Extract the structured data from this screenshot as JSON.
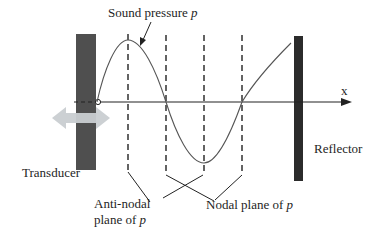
{
  "diagram": {
    "labels": {
      "sound_pressure": "Sound pressure ",
      "sound_pressure_symbol": "p",
      "axis_x": "x",
      "transducer": "Transducer",
      "reflector": "Reflector",
      "antinodal_line1": "Anti-nodal",
      "antinodal_line2": "plane of ",
      "antinodal_symbol": "p",
      "nodal": "Nodal plane of ",
      "nodal_symbol": "p"
    },
    "components": {
      "transducer": {
        "shape": "vertical-bar",
        "color": "#4a4a4a"
      },
      "reflector": {
        "shape": "vertical-bar",
        "color": "#2b2b2b"
      },
      "vibration_arrow": {
        "shape": "double-headed-arrow",
        "color": "#c9ced1"
      }
    },
    "planes": [
      {
        "type": "anti-nodal",
        "x": 128
      },
      {
        "type": "nodal",
        "x": 166
      },
      {
        "type": "anti-nodal",
        "x": 204
      },
      {
        "type": "nodal",
        "x": 242
      }
    ],
    "colors": {
      "curve": "#555555",
      "axis": "#222222",
      "text": "#1e1e1e"
    }
  }
}
